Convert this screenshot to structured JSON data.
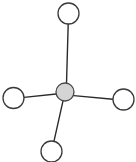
{
  "diagram": {
    "type": "node-link-diagram",
    "canvas": {
      "width": 136,
      "height": 162,
      "background_color": "#ffffff"
    },
    "style": {
      "edge_color": "#2b2b2b",
      "edge_width": 1.4,
      "leaf_fill": "#ffffff",
      "leaf_stroke": "#3a3a3a",
      "hub_fill": "#d4d4d4",
      "hub_stroke": "#4a4a4a",
      "node_stroke_width": 1.3
    },
    "nodes": [
      {
        "id": "hub",
        "role": "center",
        "label": "",
        "cx": 65,
        "cy": 92,
        "r": 9,
        "fill": "#d4d4d4"
      },
      {
        "id": "top",
        "role": "leaf",
        "label": "",
        "cx": 68.5,
        "cy": 13.5,
        "r": 10.5,
        "fill": "#ffffff"
      },
      {
        "id": "left",
        "role": "leaf",
        "label": "",
        "cx": 13.5,
        "cy": 98,
        "r": 10.5,
        "fill": "#ffffff"
      },
      {
        "id": "right",
        "role": "leaf",
        "label": "",
        "cx": 123.5,
        "cy": 99.5,
        "r": 10.5,
        "fill": "#ffffff"
      },
      {
        "id": "bottom",
        "role": "leaf",
        "label": "",
        "cx": 51.5,
        "cy": 151.5,
        "r": 10.5,
        "fill": "#ffffff"
      }
    ],
    "edges": [
      {
        "id": "edge-hub-top",
        "from": "hub",
        "to": "top",
        "x1": 66.5,
        "y1": 83.5,
        "x2": 68.2,
        "y2": 24.0
      },
      {
        "id": "edge-hub-left",
        "from": "hub",
        "to": "left",
        "x1": 56.2,
        "y1": 94.0,
        "x2": 24.0,
        "y2": 97.4
      },
      {
        "id": "edge-hub-right",
        "from": "hub",
        "to": "right",
        "x1": 73.8,
        "y1": 95.6,
        "x2": 113.0,
        "y2": 99.2
      },
      {
        "id": "edge-hub-bottom",
        "from": "hub",
        "to": "bottom",
        "x1": 63.0,
        "y1": 100.8,
        "x2": 54.0,
        "y2": 141.2
      }
    ]
  }
}
